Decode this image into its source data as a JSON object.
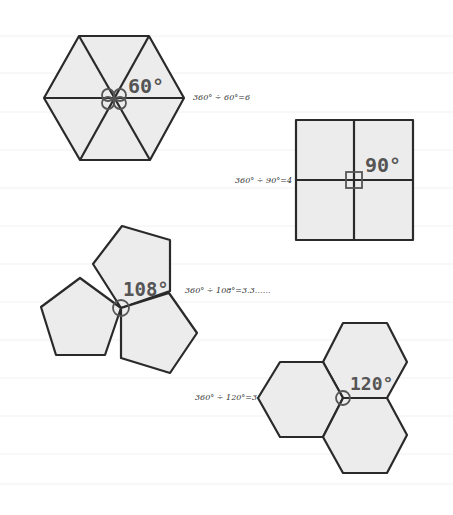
{
  "figures": [
    {
      "shape": "regular hexagon divided into 6 equilateral triangles",
      "angle_label": "60°",
      "equation": "360° ÷ 60°=6"
    },
    {
      "shape": "square divided into 4 squares",
      "angle_label": "90°",
      "equation": "360° ÷ 90°=4"
    },
    {
      "shape": "three regular pentagons meeting at a vertex",
      "angle_label": "108°",
      "equation": "360° ÷ 108°=3.3……"
    },
    {
      "shape": "three regular hexagons meeting at a vertex",
      "angle_label": "120°",
      "equation": "360° ÷ 120°=3"
    }
  ],
  "colors": {
    "fill": "#ececec",
    "stroke": "#2a2a2a",
    "angle_mark": "#555555"
  }
}
